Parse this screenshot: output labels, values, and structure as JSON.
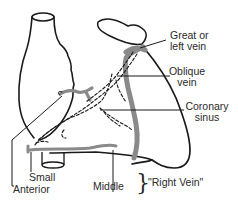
{
  "figure": {
    "colors": {
      "outline": "#1a1a1a",
      "vein": "#8a8a8a",
      "background": "#ffffff"
    }
  },
  "labels": {
    "great_vein": {
      "line1": "Great or",
      "line2": "left vein"
    },
    "oblique_vein": {
      "line1": "Oblique",
      "line2": "vein"
    },
    "coronary_sinus": {
      "line1": "Coronary",
      "line2": "sinus"
    },
    "small": "Small",
    "anterior": "Anterior",
    "middle": "Middle",
    "right_vein_brace": "}",
    "right_vein": "\"Right Vein\""
  }
}
